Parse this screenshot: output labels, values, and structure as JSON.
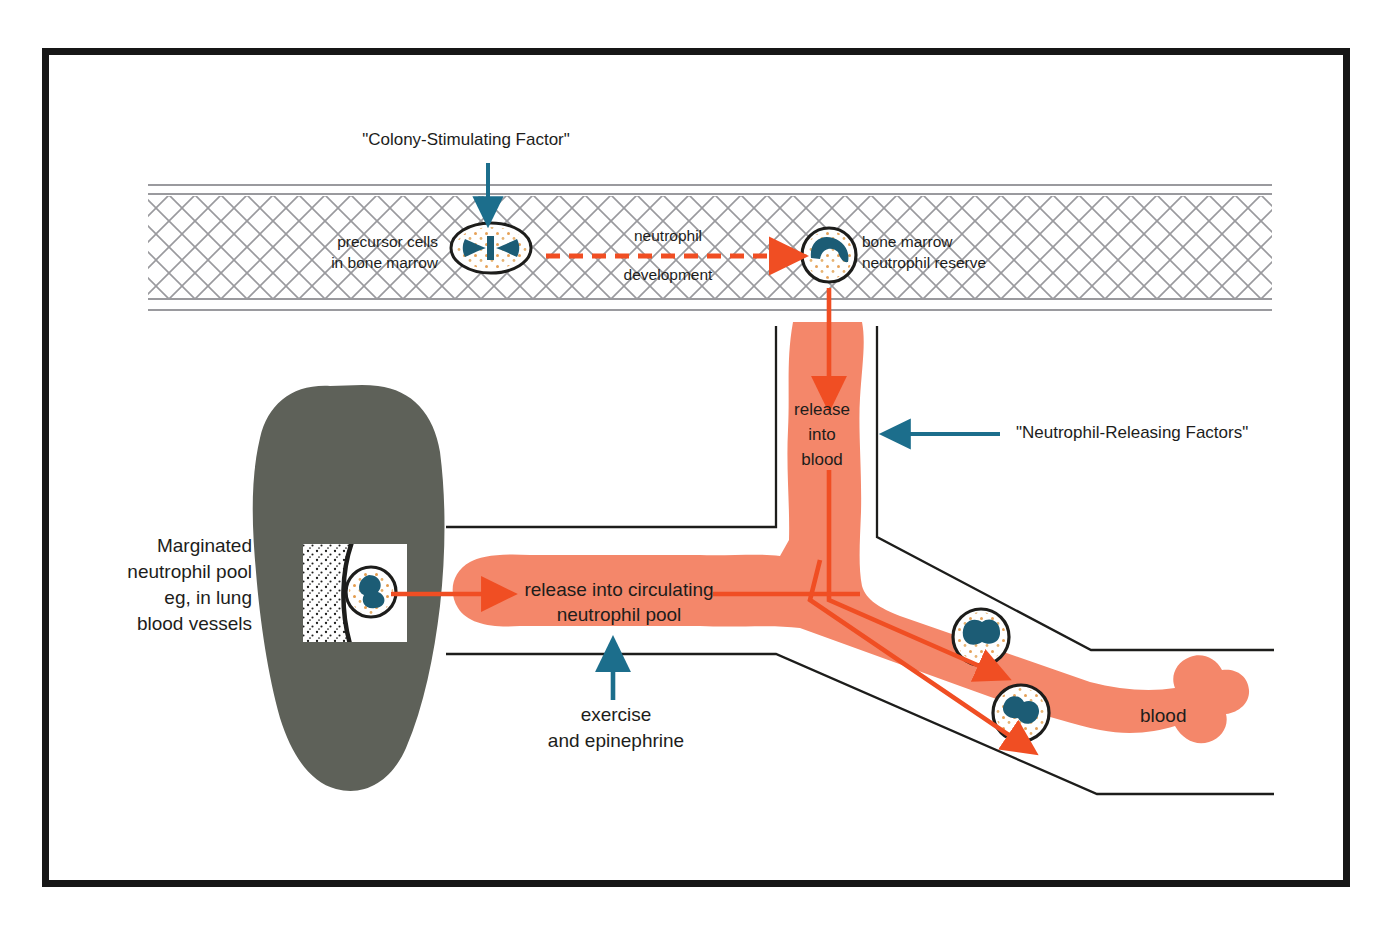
{
  "figure": {
    "title_fragment": "",
    "domain": "biology-diagram"
  },
  "colors": {
    "frame": "#171717",
    "blood_vessel_fill": "#F4876A",
    "vessel_outline": "#1d1d1b",
    "red_arrow": "#F04E23",
    "teal_arrow": "#1C6E8C",
    "lung_gray": "#5E6159",
    "marrow_hatch": "#9a9a9e",
    "nucleus_teal": "#1C5C75",
    "granule_orange": "#E08A2E",
    "text": "#1d1d1b",
    "background": "#ffffff"
  },
  "labels": {
    "colony_stimulating_factor": "\"Colony-Stimulating Factor\"",
    "precursor_cells_line1": "precursor cells",
    "precursor_cells_line2": "in bone marrow",
    "neutrophil_development_line1": "neutrophil",
    "neutrophil_development_line2": "development",
    "bone_marrow_reserve_line1": "bone marrow",
    "bone_marrow_reserve_line2": "neutrophil reserve",
    "release_into_blood_line1": "release",
    "release_into_blood_line2": "into",
    "release_into_blood_line3": "blood",
    "neutrophil_releasing_factors": "\"Neutrophil-Releasing Factors\"",
    "marginated_pool_line1": "Marginated",
    "marginated_pool_line2": "neutrophil pool",
    "marginated_pool_line3": "eg, in lung",
    "marginated_pool_line4": "blood vessels",
    "release_circulating_line1": "release into circulating",
    "release_circulating_line2": "neutrophil pool",
    "exercise_line1": "exercise",
    "exercise_line2": "and epinephrine",
    "blood": "blood"
  },
  "icons": {
    "csf_arrow": "arrow-down-icon",
    "development_arrow": "dashed-arrow-right-icon",
    "reserve_release_arrow": "arrow-down-icon",
    "releasing_factors_arrow": "arrow-left-icon",
    "margination_arrow": "arrow-right-icon",
    "exercise_arrow": "arrow-up-icon",
    "circulation_arrow": "arrow-right-icon"
  },
  "cells": [
    {
      "name": "precursor-cell",
      "type": "dividing-precursor",
      "shape": "ellipse",
      "location": "bone marrow"
    },
    {
      "name": "reserve-neutrophil",
      "type": "band-neutrophil",
      "shape": "circle",
      "location": "bone marrow reserve"
    },
    {
      "name": "marginated-neutrophil",
      "type": "segmented-neutrophil",
      "shape": "circle",
      "location": "lung vessel wall"
    },
    {
      "name": "circulating-neutrophil-upper",
      "type": "segmented-neutrophil",
      "shape": "circle",
      "location": "blood"
    },
    {
      "name": "circulating-neutrophil-lower",
      "type": "segmented-neutrophil",
      "shape": "circle",
      "location": "blood"
    }
  ]
}
